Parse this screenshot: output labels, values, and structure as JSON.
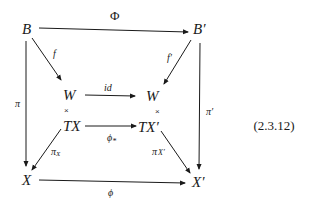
{
  "diagram": {
    "nodes": {
      "B": "B",
      "B_prime": "B′",
      "W": "W",
      "W_prime": "W",
      "TX": "TX",
      "TX_prime": "TX′",
      "X": "X",
      "X_prime": "X′"
    },
    "labels": {
      "Phi": "Φ",
      "f": "f",
      "f_prime": "f′",
      "id": "id",
      "phi_star": "ϕ",
      "phi_star_sub": "*",
      "pi": "π",
      "pi_prime": "π′",
      "pi_X": "π",
      "pi_X_sub": "X",
      "pi_X_prime": "π",
      "pi_X_prime_sub": "X′",
      "phi": "ϕ",
      "times_left": "×",
      "times_right": "×"
    },
    "equation_number": "(2.3.12)"
  }
}
